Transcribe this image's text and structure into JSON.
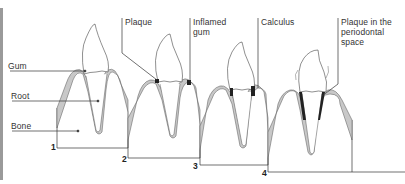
{
  "diagram": {
    "labels": {
      "gum": "Gum",
      "root": "Root",
      "bone": "Bone",
      "plaque": "Plaque",
      "inflamed_gum_line1": "Inflamed",
      "inflamed_gum_line2": "gum",
      "calculus": "Calculus",
      "plaque_perio_line1": "Plaque in the",
      "plaque_perio_line2": "periodontal",
      "plaque_perio_line3": "space"
    },
    "stages": [
      "1",
      "2",
      "3",
      "4"
    ],
    "colors": {
      "bone_fill": "#c8c8c8",
      "line": "#333333",
      "border": "#9a9a9a"
    }
  }
}
